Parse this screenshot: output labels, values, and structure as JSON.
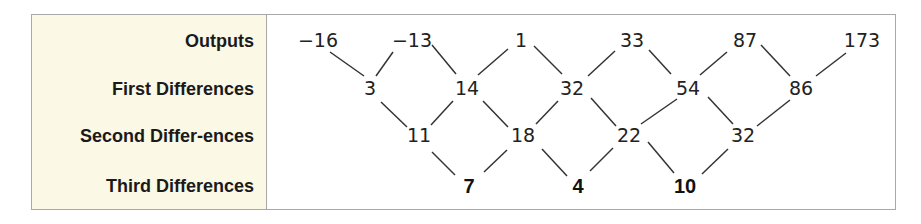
{
  "table": {
    "row_labels": [
      "Outputs",
      "First Differences",
      "Second Differ-ences",
      "Third Differences"
    ],
    "outputs": [
      "−16",
      "−13",
      "1",
      "33",
      "87",
      "173"
    ],
    "first_differences": [
      "3",
      "14",
      "32",
      "54",
      "86"
    ],
    "second_differences": [
      "11",
      "18",
      "22",
      "32"
    ],
    "third_differences": [
      "7",
      "4",
      "10"
    ]
  },
  "colors": {
    "label_background": "#fbf8e6",
    "border": "#a8a8a8",
    "line": "#333333"
  }
}
